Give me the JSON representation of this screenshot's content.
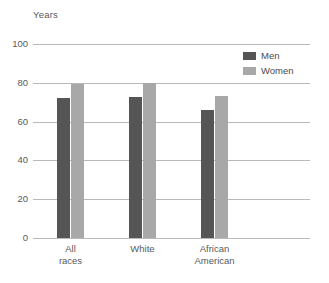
{
  "chart_data": {
    "type": "bar",
    "title": "",
    "subtitle": "",
    "xlabel": "",
    "ylabel": "Years",
    "categories": [
      "All\nraces",
      "White",
      "African\nAmerican"
    ],
    "series": [
      {
        "name": "Men",
        "color": "#555555",
        "values": [
          72,
          72.5,
          66
        ]
      },
      {
        "name": "Women",
        "color": "#a8a8a8",
        "values": [
          79.5,
          80,
          73
        ]
      }
    ],
    "ylim": [
      0,
      100
    ],
    "yticks": [
      100,
      80,
      60,
      40,
      20,
      0
    ],
    "ytick_labels": [
      "100",
      "80",
      "60",
      "40",
      "20",
      "0"
    ],
    "grid": true,
    "legend_position": "top-right",
    "legend_entries": [
      "Men",
      "Women"
    ],
    "annotations": []
  },
  "colors": {
    "men": "#555555",
    "women": "#a8a8a8",
    "gridline": "#b9b9b9",
    "text": "#4a4a4a",
    "background": "#ffffff"
  }
}
